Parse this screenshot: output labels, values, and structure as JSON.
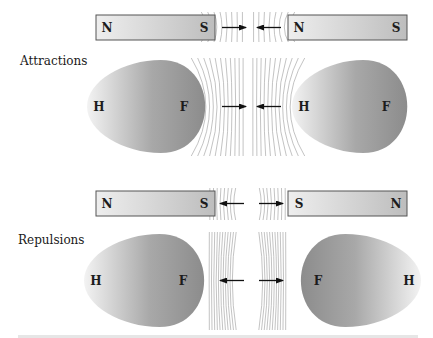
{
  "diagram": {
    "sections": [
      {
        "id": "attractions",
        "label": "Attractions",
        "field_pattern": "converging",
        "arrow_direction": "inward",
        "magnets": [
          {
            "left_pole": "N",
            "right_pole": "S"
          },
          {
            "left_pole": "N",
            "right_pole": "S"
          }
        ],
        "eggs": [
          {
            "pointed_end_label": "H",
            "blunt_end_label": "F",
            "blunt_side": "right"
          },
          {
            "pointed_end_label": "H",
            "blunt_end_label": "F",
            "blunt_side": "right"
          }
        ]
      },
      {
        "id": "repulsions",
        "label": "Repulsions",
        "field_pattern": "diverging",
        "arrow_direction": "outward",
        "magnets": [
          {
            "left_pole": "N",
            "right_pole": "S"
          },
          {
            "left_pole": "S",
            "right_pole": "N"
          }
        ],
        "eggs": [
          {
            "pointed_end_label": "H",
            "blunt_end_label": "F",
            "blunt_side": "right"
          },
          {
            "pointed_end_label": "H",
            "blunt_end_label": "F",
            "blunt_side": "left"
          }
        ]
      }
    ],
    "colors": {
      "magnet_light": "#eeeeee",
      "magnet_dark": "#bdbdbd",
      "magnet_border": "#555555",
      "egg_light": "#f3f3f3",
      "egg_dark": "#8c8c8c",
      "field_line": "#9a9a9a",
      "arrow": "#111111"
    }
  }
}
